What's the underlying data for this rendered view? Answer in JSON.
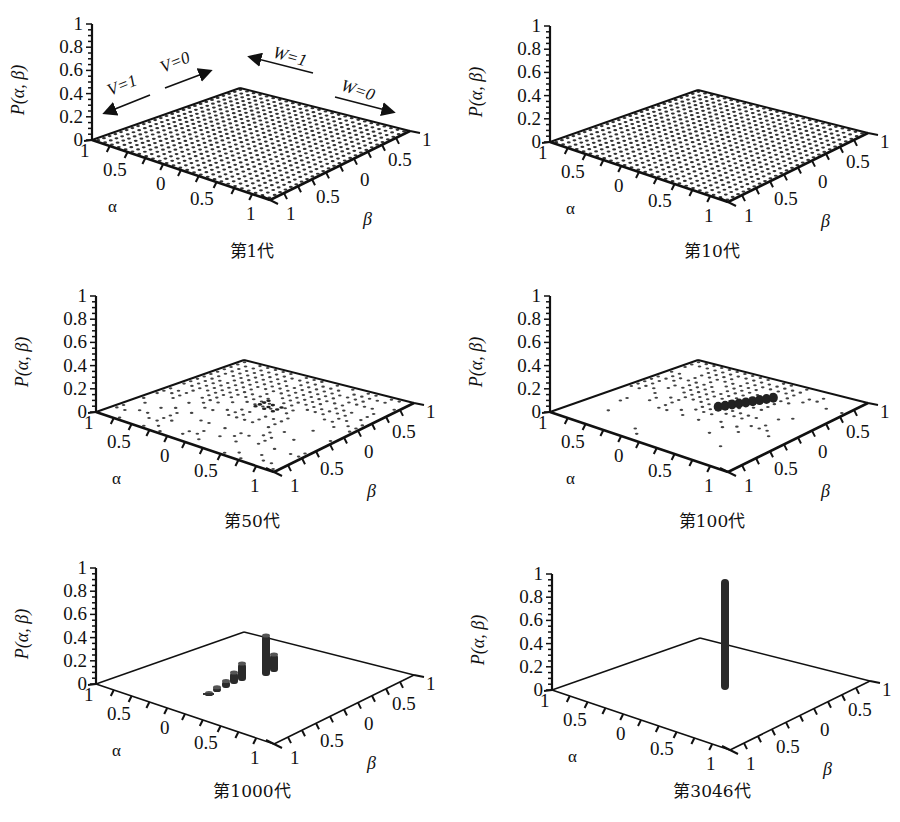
{
  "figure": {
    "caption_clipped": true,
    "panels": [
      {
        "id": "gen1",
        "caption": "第1代",
        "pattern": "uniform"
      },
      {
        "id": "gen10",
        "caption": "第10代",
        "pattern": "uniform"
      },
      {
        "id": "gen50",
        "caption": "第50代",
        "pattern": "sparse"
      },
      {
        "id": "gen100",
        "caption": "第100代",
        "pattern": "clustered"
      },
      {
        "id": "gen1000",
        "caption": "第1000代",
        "pattern": "bars"
      },
      {
        "id": "gen3046",
        "caption": "第3046代",
        "pattern": "spike"
      }
    ]
  },
  "axes": {
    "z_label": "P(α, β)",
    "x_label": "α",
    "y_label": "β",
    "z_ticks": [
      "1",
      "0.8",
      "0.6",
      "0.4",
      "0.2",
      "0"
    ],
    "alpha_ticks": [
      "1",
      "0.5",
      "0",
      "0.5",
      "1"
    ],
    "beta_ticks": [
      "1",
      "0.5",
      "0",
      "0.5",
      "1"
    ]
  },
  "annotations": {
    "v1": "V=1",
    "v0": "V=0",
    "w1": "W=1",
    "w0": "W=0"
  },
  "chart_data": [
    {
      "type": "bar3d",
      "title": "第1代",
      "xlabel": "α",
      "ylabel": "β",
      "zlabel": "P(α, β)",
      "xlim": [
        -1,
        1
      ],
      "ylim": [
        -1,
        1
      ],
      "zlim": [
        0,
        1
      ],
      "z_ticks": [
        0,
        0.2,
        0.4,
        0.6,
        0.8,
        1
      ],
      "description": "Uniform distribution over a dense α-β grid; every cell near 0",
      "peak": {
        "alpha": null,
        "beta": null,
        "value": 0.002
      },
      "annotations": [
        "V=1",
        "V=0",
        "W=1",
        "W=0"
      ]
    },
    {
      "type": "bar3d",
      "title": "第10代",
      "xlabel": "α",
      "ylabel": "β",
      "zlabel": "P(α, β)",
      "xlim": [
        -1,
        1
      ],
      "ylim": [
        -1,
        1
      ],
      "zlim": [
        0,
        1
      ],
      "description": "Still approximately uniform over full grid",
      "peak": {
        "alpha": null,
        "beta": null,
        "value": 0.002
      }
    },
    {
      "type": "bar3d",
      "title": "第50代",
      "xlabel": "α",
      "ylabel": "β",
      "zlabel": "P(α, β)",
      "xlim": [
        -1,
        1
      ],
      "ylim": [
        -1,
        1
      ],
      "zlim": [
        0,
        1
      ],
      "description": "Distribution thinning; cells on one side of the β range vanish, slight concentration near center",
      "peak": {
        "alpha": 0,
        "beta": 0,
        "value": 0.01
      }
    },
    {
      "type": "bar3d",
      "title": "第100代",
      "xlabel": "α",
      "ylabel": "β",
      "zlabel": "P(α, β)",
      "xlim": [
        -1,
        1
      ],
      "ylim": [
        -1,
        1
      ],
      "zlim": [
        0,
        1
      ],
      "description": "Mass concentrating into a small ridge of cells near the center",
      "peak": {
        "alpha": 0,
        "beta": 0,
        "value": 0.03
      }
    },
    {
      "type": "bar3d",
      "title": "第1000代",
      "xlabel": "α",
      "ylabel": "β",
      "zlabel": "P(α, β)",
      "xlim": [
        -1,
        1
      ],
      "ylim": [
        -1,
        1
      ],
      "zlim": [
        0,
        1
      ],
      "description": "A few bars along a diagonal line, tallest about 0.35",
      "bars": [
        {
          "label": "b1",
          "value": 0.02
        },
        {
          "label": "b2",
          "value": 0.04
        },
        {
          "label": "b3",
          "value": 0.06
        },
        {
          "label": "b4",
          "value": 0.1
        },
        {
          "label": "b5",
          "value": 0.15
        },
        {
          "label": "b6",
          "value": 0.35
        },
        {
          "label": "b7",
          "value": 0.15
        }
      ],
      "peak": {
        "value": 0.35
      }
    },
    {
      "type": "bar3d",
      "title": "第3046代",
      "xlabel": "α",
      "ylabel": "β",
      "zlabel": "P(α, β)",
      "xlim": [
        -1,
        1
      ],
      "ylim": [
        -1,
        1
      ],
      "zlim": [
        0,
        1
      ],
      "description": "Converged: single bar with probability 1",
      "peak": {
        "value": 1.0
      }
    }
  ]
}
